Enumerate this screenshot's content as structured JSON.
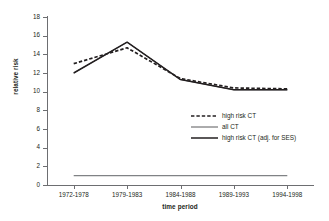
{
  "chart_data": {
    "type": "line",
    "title": "",
    "xlabel": "time period",
    "ylabel": "relative risk",
    "categories": [
      "1972-1978",
      "1979-1983",
      "1984-1988",
      "1989-1993",
      "1994-1998"
    ],
    "ylim": [
      0,
      18
    ],
    "yticks": [
      0,
      2,
      4,
      6,
      8,
      10,
      12,
      14,
      16,
      18
    ],
    "grid": false,
    "legend_position": "center-right",
    "series": [
      {
        "name": "high risk CT",
        "style": "dashed",
        "color": "#231f20",
        "values": [
          13.0,
          14.7,
          11.4,
          10.4,
          10.3
        ]
      },
      {
        "name": "all CT",
        "style": "solid-thin",
        "color": "#58595b",
        "values": [
          12.0,
          15.3,
          11.3,
          10.2,
          10.2
        ]
      },
      {
        "name": "high risk CT (adj. for SES)",
        "style": "solid-thick",
        "color": "#231f20",
        "values": [
          12.0,
          15.3,
          11.3,
          10.2,
          10.2
        ]
      }
    ],
    "reference_line": {
      "name": "reference",
      "value": 1.0,
      "color": "#808285"
    }
  },
  "legend": {
    "items": [
      {
        "label": "high risk CT"
      },
      {
        "label": "all CT"
      },
      {
        "label": "high risk CT (adj. for SES)"
      }
    ]
  },
  "axes": {
    "y_tick_labels": [
      "18",
      "16",
      "14",
      "12",
      "10",
      "8",
      "6",
      "4",
      "2",
      "0"
    ],
    "x_tick_labels": [
      "1972-1978",
      "1979-1983",
      "1984-1988",
      "1989-1993",
      "1994-1998"
    ]
  }
}
